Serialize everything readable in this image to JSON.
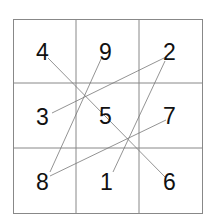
{
  "diagram": {
    "type": "magic-square-grid",
    "rows": 3,
    "cols": 3,
    "cells": [
      [
        "4",
        "9",
        "2"
      ],
      [
        "3",
        "5",
        "7"
      ],
      [
        "8",
        "1",
        "6"
      ]
    ],
    "connections": [
      {
        "from": "4",
        "to": "6"
      },
      {
        "from": "9",
        "to": "8"
      },
      {
        "from": "2",
        "to": "3"
      },
      {
        "from": "2",
        "to": "1"
      },
      {
        "from": "7",
        "to": "8"
      }
    ],
    "colors": {
      "grid_line": "#888888",
      "connector_line": "#777777",
      "text": "#111111",
      "background": "#ffffff"
    }
  }
}
